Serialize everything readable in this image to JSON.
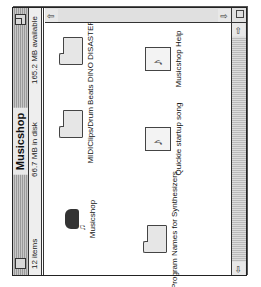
{
  "window": {
    "title": "Musicshop",
    "info": {
      "items": "12 items",
      "in_disk": "66.7 MB in disk",
      "available": "165.2 MB available"
    }
  },
  "icons": [
    {
      "name": "Musicshop",
      "kind": "application"
    },
    {
      "name": "MIDIClips/Drum Beats",
      "kind": "folder"
    },
    {
      "name": "DINO DISASTER",
      "kind": "folder"
    },
    {
      "name": "Program Names for Synthesizers",
      "kind": "folder"
    },
    {
      "name": "Quickie startup song",
      "kind": "document"
    },
    {
      "name": "Musicshop Help",
      "kind": "document"
    }
  ],
  "scrollbars": {
    "up_arrow": "⇧",
    "down_arrow": "⇩",
    "left_arrow": "⇦",
    "right_arrow": "⇨"
  },
  "colors": {
    "window_border": "#222222",
    "scroll_track": "#dddddd"
  }
}
